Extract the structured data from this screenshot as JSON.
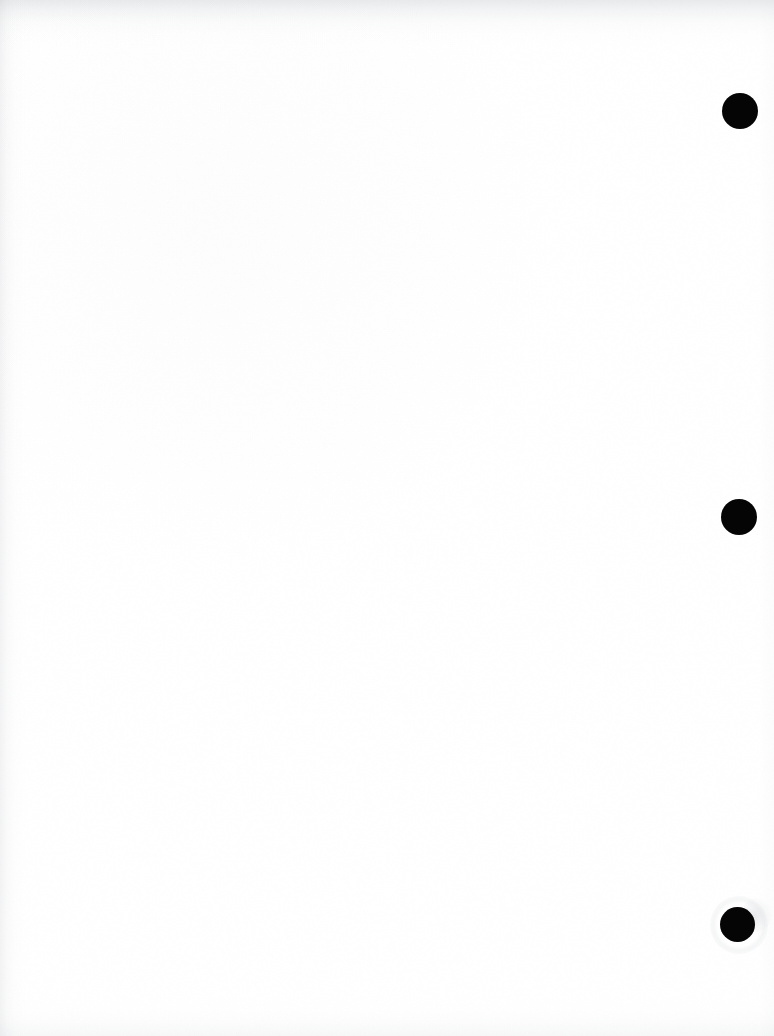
{
  "page": {
    "width": 774,
    "height": 1036,
    "background_color": "#ffffff",
    "body_text": ""
  },
  "marks": {
    "color": "#050505",
    "items": [
      {
        "name": "registration-dot-top",
        "cx": 740,
        "cy": 111,
        "d": 36
      },
      {
        "name": "registration-dot-middle",
        "cx": 739,
        "cy": 517,
        "d": 36
      },
      {
        "name": "registration-dot-bottom",
        "cx": 737,
        "cy": 924,
        "d": 35
      }
    ]
  },
  "artifacts": {
    "smudge": {
      "x": 742,
      "y": 898,
      "w": 30,
      "h": 34
    },
    "smudge_halo": {
      "x": 710,
      "y": 896,
      "w": 58,
      "h": 58
    }
  },
  "edges": {
    "top_shadow_color": "#8c9298",
    "left_shadow_color": "#969ca2",
    "bottom_shadow_color": "#b0b5bb",
    "right_shadow_color": "#bec2c7"
  }
}
